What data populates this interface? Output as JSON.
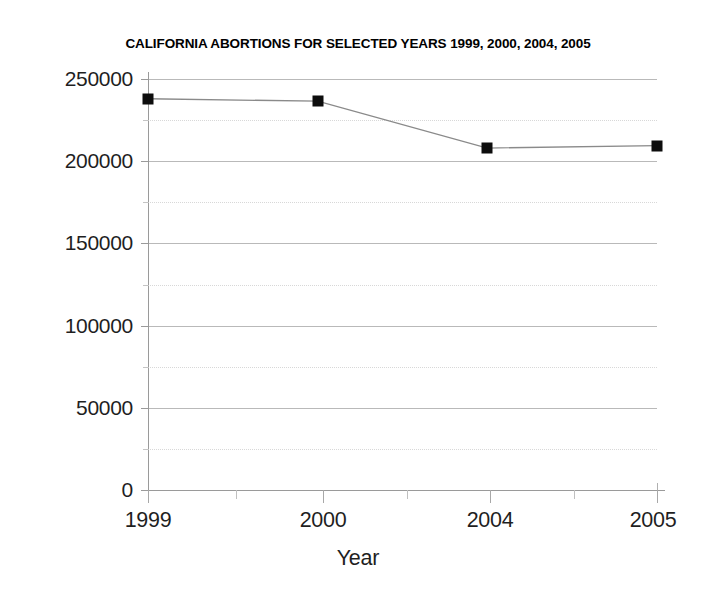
{
  "chart_data": {
    "type": "line",
    "title": "CALIFORNIA ABORTIONS FOR SELECTED YEARS 1999, 2000, 2004, 2005",
    "xlabel": "Year",
    "ylabel": "",
    "categories": [
      "1999",
      "2000",
      "2004",
      "2005"
    ],
    "values": [
      238000,
      236500,
      208000,
      209500
    ],
    "series": [
      {
        "name": "California abortions",
        "values": [
          238000,
          236500,
          208000,
          209500
        ]
      }
    ],
    "ylim": [
      0,
      250000
    ],
    "y_major_ticks": [
      0,
      50000,
      100000,
      150000,
      200000,
      250000
    ],
    "y_minor_ticks": [
      25000,
      75000,
      125000,
      175000,
      225000
    ],
    "y_tick_labels": [
      "0",
      "50000",
      "100000",
      "150000",
      "200000",
      "250000"
    ],
    "x_tick_labels": [
      "1999",
      "2000",
      "2004",
      "2005"
    ],
    "grid": true,
    "grid_major_color": "#b9b9b9",
    "grid_minor_color": "#d8d8d8",
    "legend": false,
    "legend_position": "none",
    "marker": "square",
    "marker_color": "#0d0d0d",
    "line_color": "#8a8a8a",
    "background_color": "#ffffff"
  },
  "axis": {
    "y_labels": [
      "250000",
      "200000",
      "150000",
      "100000",
      "50000",
      "0"
    ],
    "x_labels": [
      "1999",
      "2000",
      "2004",
      "2005"
    ],
    "x_title": "Year"
  }
}
